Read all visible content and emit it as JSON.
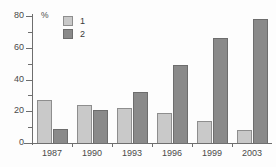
{
  "chart_data": {
    "type": "bar",
    "title": "",
    "subtitle": "",
    "xlabel": "",
    "ylabel": "%",
    "ylim": [
      0,
      80
    ],
    "ytick_labels": [
      "0",
      "20",
      "40",
      "60",
      "80"
    ],
    "ytick_values": [
      0,
      20,
      40,
      60,
      80
    ],
    "yminor_values": [
      10,
      30,
      50,
      70
    ],
    "grid": false,
    "legend_position": "top-left",
    "categories": [
      "1987",
      "1990",
      "1993",
      "1996",
      "1999",
      "2003"
    ],
    "series": [
      {
        "name": "1",
        "color": "#c9c9c9",
        "values": [
          27,
          24,
          22,
          19,
          14,
          8
        ]
      },
      {
        "name": "2",
        "color": "#8a8a8a",
        "values": [
          9,
          21,
          32,
          49,
          66,
          78
        ]
      }
    ]
  },
  "legend": {
    "items": [
      {
        "label": "1"
      },
      {
        "label": "2"
      }
    ]
  },
  "axis": {
    "unit_label": "%"
  }
}
